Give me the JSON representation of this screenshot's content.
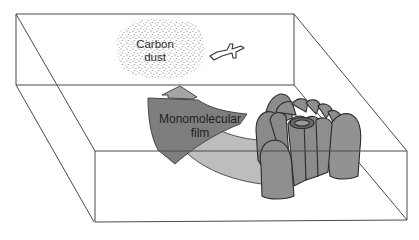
{
  "diagram": {
    "type": "3d-box-schematic",
    "labels": {
      "dust_line1": "Carbon",
      "dust_line2": "dust",
      "film_line1": "Monomolecular",
      "film_line2": "film"
    },
    "icons": {
      "airplane": "airplane-icon",
      "dust_cloud": "stippled-dust-cloud",
      "cell_cluster": "cylindrical-cell-cluster",
      "arrow": "curved-arrow-with-upward-head"
    },
    "colors": {
      "outline": "#3a3a3a",
      "dark_gray": "#7c7c7c",
      "mid_gray": "#8f8f8f",
      "light_gray": "#bdbdbd",
      "stipple": "#555555"
    }
  }
}
